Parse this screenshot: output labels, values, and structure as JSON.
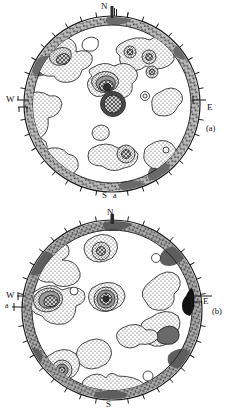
{
  "figure": {
    "type": "stereographic-contour-diagram-pair",
    "background": "#ffffff",
    "ink": "#1a1a1a"
  },
  "panels": [
    {
      "id": "a",
      "panel_label": "(a)",
      "panel_label_pos": {
        "x": 208,
        "y": 123
      },
      "center": {
        "cx": 112,
        "cy": 104
      },
      "radius": 88,
      "rim_inner_radius": 79,
      "compass": {
        "north": {
          "label": "N",
          "x": 104,
          "y": 5
        },
        "east": {
          "label": "E",
          "x": 206,
          "y": 99
        },
        "west": {
          "label": "W",
          "x": 9,
          "y": 99
        },
        "south": {
          "label": "S",
          "x": 104,
          "y": 192
        },
        "extra": {
          "label": "a",
          "x": 116,
          "y": 192
        }
      },
      "tick_count": 36,
      "tick_length": 5,
      "has_north_bar": true,
      "has_west_bracket": true,
      "has_east_bar": true
    },
    {
      "id": "b",
      "panel_label": "(b)",
      "panel_label_pos": {
        "x": 212,
        "y": 306
      },
      "center": {
        "cx": 112,
        "cy": 310
      },
      "radius": 90,
      "rim_inner_radius": 80,
      "compass": {
        "north": {
          "label": "N",
          "x": 109,
          "y": 212
        },
        "east": {
          "label": "E",
          "x": 203,
          "y": 301
        },
        "west": {
          "label": "W",
          "x": 13,
          "y": 294
        },
        "south": {
          "label": "S",
          "x": 108,
          "y": 402
        },
        "extra": {
          "label": "a",
          "x": 8,
          "y": 305
        }
      },
      "tick_count": 36,
      "tick_length": 5,
      "has_north_bar": true,
      "has_west_tick": true,
      "has_east_bar": true,
      "has_dark_wedge_ne": true
    }
  ],
  "contour_legend": {
    "levels": [
      "open (lowest)",
      "stippled",
      "dense-stipple",
      "dark / cross-hatched (maximum)"
    ],
    "fill_open": "#ffffff",
    "fill_stipple": "#ffffff",
    "fill_dense": "#bdbdbd",
    "fill_dark": "#555555",
    "rim_band": "#9a9a9a"
  }
}
